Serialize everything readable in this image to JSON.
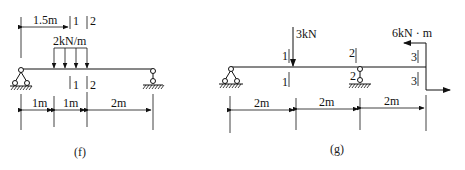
{
  "figures": [
    {
      "id": "f",
      "caption": "(f)",
      "distributed_load": {
        "label": "2kN/m",
        "value": 2,
        "unit": "kN/m"
      },
      "top_dimension": {
        "label": "1.5m"
      },
      "sections": [
        {
          "top_label": "1",
          "bottom_label": "1"
        },
        {
          "top_label": "2",
          "bottom_label": "2"
        }
      ],
      "dimensions": [
        "1m",
        "1m",
        "2m"
      ],
      "supports": [
        "pin",
        "roller"
      ]
    },
    {
      "id": "g",
      "caption": "(g)",
      "point_load": {
        "label": "3kN",
        "value": 3,
        "unit": "kN"
      },
      "moment": {
        "label": "6kN · m",
        "value": 6,
        "unit": "kN·m"
      },
      "sections": [
        {
          "top_label": "1",
          "bottom_label": "1"
        },
        {
          "top_label": "2",
          "bottom_label": "2"
        },
        {
          "top_label": "3",
          "bottom_label": "3"
        }
      ],
      "dimensions": [
        "2m",
        "2m",
        "2m"
      ],
      "supports": [
        "pin",
        "roller"
      ]
    }
  ]
}
